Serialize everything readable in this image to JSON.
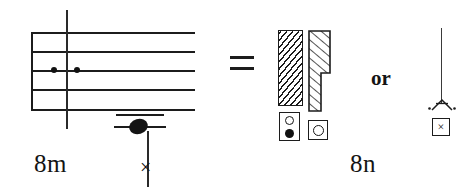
{
  "figure": {
    "background_color": "#ffffff",
    "ink_color": "#1c1c1c"
  },
  "left_panel": {
    "caption": "8m",
    "staff": {
      "line_count": 5,
      "has_left_barline": true,
      "barline": {
        "label": "barline"
      },
      "dots": [
        {
          "label": "dot-left",
          "position": "middle-line"
        },
        {
          "label": "dot-right",
          "position": "middle-line"
        }
      ]
    },
    "low_note": {
      "notehead": "filled-notehead",
      "ledger_line_count": 2,
      "stem_direction": "down",
      "stem_terminator": "×"
    }
  },
  "relation": {
    "equals_sign": "=",
    "or_label": "or"
  },
  "right_panel": {
    "caption": "8n",
    "bars": [
      {
        "name": "hatched-bar-full",
        "hatch": "diagonal",
        "shape": "rectangle"
      },
      {
        "name": "hatched-bar-stepped",
        "hatch": "diagonal",
        "shape": "stepped-rectangle"
      }
    ],
    "symbol_boxes": [
      {
        "name": "symbol-box-two-circles",
        "contents": [
          "hollow-circle",
          "filled-circle"
        ]
      },
      {
        "name": "symbol-box-one-circle",
        "contents": [
          "hollow-circle"
        ]
      }
    ],
    "alternative": {
      "stem": "vertical-stem",
      "arrow_head": "arrowhead-with-dots",
      "boxed_symbol": "×"
    }
  }
}
